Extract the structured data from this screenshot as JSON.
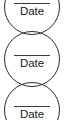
{
  "page": {
    "background_color": "#ffffff",
    "stroke_color": "#2b2b2b",
    "text_color": "#1a1a1a",
    "width": 65,
    "height": 120
  },
  "signature_stamps": [
    {
      "name": "date-stamp-1",
      "label": "Date",
      "rule_visible": true,
      "top": -21,
      "clipped": "top"
    },
    {
      "name": "date-stamp-2",
      "label": "Date",
      "rule_visible": true,
      "top": 31,
      "clipped": "none"
    },
    {
      "name": "date-stamp-3",
      "label": "Date",
      "rule_visible": true,
      "top": 82,
      "clipped": "bottom"
    }
  ]
}
